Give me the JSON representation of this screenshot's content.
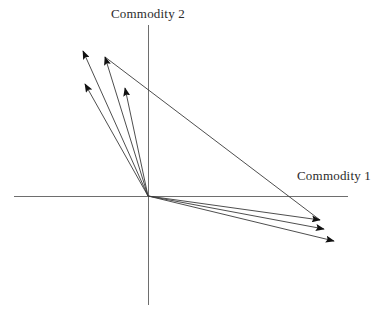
{
  "figure": {
    "width": 381,
    "height": 313,
    "background_color": "#ffffff",
    "stroke_color": "#3a3a3a",
    "axis_color": "#6e6e6e",
    "arrow_color": "#111111"
  },
  "axes": {
    "vertical": {
      "label": "Commodity 2",
      "x": 148,
      "y_top": 25,
      "y_bottom": 305
    },
    "horizontal": {
      "label": "Commodity 1",
      "y": 196,
      "x_left": 14,
      "x_right": 348
    },
    "origin": {
      "x": 148,
      "y": 196
    }
  },
  "chart_data": {
    "type": "scatter",
    "title": "",
    "xlabel": "Commodity 1",
    "ylabel": "Commodity 2",
    "grid": false,
    "legend": null,
    "origin": {
      "x": 148,
      "y": 196
    },
    "vectors": [
      {
        "name": "upper-left-vector-1",
        "quadrant": "upper-left",
        "from": {
          "x": 148,
          "y": 196
        },
        "to": {
          "x": 83,
          "y": 51
        }
      },
      {
        "name": "upper-left-vector-2",
        "quadrant": "upper-left",
        "from": {
          "x": 148,
          "y": 196
        },
        "to": {
          "x": 105,
          "y": 57
        }
      },
      {
        "name": "upper-left-vector-3",
        "quadrant": "upper-left",
        "from": {
          "x": 148,
          "y": 196
        },
        "to": {
          "x": 85,
          "y": 84
        }
      },
      {
        "name": "upper-left-vector-4",
        "quadrant": "upper-left",
        "from": {
          "x": 148,
          "y": 196
        },
        "to": {
          "x": 125,
          "y": 88
        }
      },
      {
        "name": "lower-right-vector-1",
        "quadrant": "lower-right",
        "from": {
          "x": 148,
          "y": 196
        },
        "to": {
          "x": 320,
          "y": 220
        }
      },
      {
        "name": "lower-right-vector-2",
        "quadrant": "lower-right",
        "from": {
          "x": 148,
          "y": 196
        },
        "to": {
          "x": 324,
          "y": 229
        }
      },
      {
        "name": "lower-right-vector-3",
        "quadrant": "lower-right",
        "from": {
          "x": 148,
          "y": 196
        },
        "to": {
          "x": 334,
          "y": 241
        }
      }
    ],
    "budget_line": {
      "name": "budget-line",
      "from": {
        "x": 105,
        "y": 57
      },
      "to": {
        "x": 320,
        "y": 220
      }
    }
  }
}
